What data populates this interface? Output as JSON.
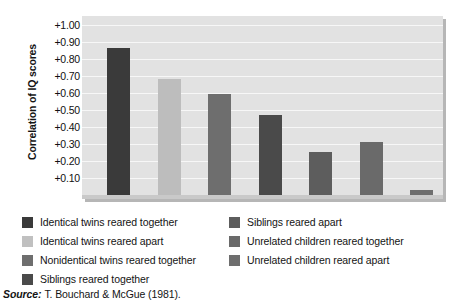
{
  "chart_data": {
    "type": "bar",
    "title": "",
    "xlabel": "",
    "ylabel": "Correlation of IQ scores",
    "ylim": [
      0.0,
      1.05
    ],
    "grid": true,
    "legend_position": "bottom",
    "ytick_labels": [
      "+1.00",
      "+0.90",
      "+0.80",
      "+0.70",
      "+0.60",
      "+0.50",
      "+0.40",
      "+0.30",
      "+0.20",
      "+0.10"
    ],
    "ytick_values": [
      1.0,
      0.9,
      0.8,
      0.7,
      0.6,
      0.5,
      0.4,
      0.3,
      0.2,
      0.1
    ],
    "categories": [
      "Identical twins reared together",
      "Identical twins reared apart",
      "Nonidentical twins reared together",
      "Siblings reared together",
      "Siblings reared apart",
      "Unrelated children reared together",
      "Unrelated children reared apart"
    ],
    "values": [
      0.86,
      0.68,
      0.59,
      0.47,
      0.25,
      0.31,
      0.03
    ],
    "bar_colors": [
      "#3a3a3a",
      "#bdbdbd",
      "#6e6e6e",
      "#4a4a4a",
      "#5d5d5d",
      "#6a6a6a",
      "#6e6e6e"
    ]
  },
  "axis": {
    "y_title": "Correlation of IQ scores"
  },
  "legend": {
    "left_column": [
      {
        "label": "Identical twins reared together",
        "color": "#3a3a3a"
      },
      {
        "label": "Identical twins reared apart",
        "color": "#c0c0c0"
      },
      {
        "label": "Nonidentical twins reared together",
        "color": "#6e6e6e"
      },
      {
        "label": "Siblings reared together",
        "color": "#4a4a4a"
      }
    ],
    "right_column": [
      {
        "label": "Siblings reared apart",
        "color": "#5d5d5d"
      },
      {
        "label": "Unrelated children reared together",
        "color": "#6a6a6a"
      },
      {
        "label": "Unrelated children reared apart",
        "color": "#6e6e6e"
      }
    ]
  },
  "source": {
    "label": "Source:",
    "text": "T. Bouchard & McGue (1981)."
  },
  "colors": {
    "plot_background": "#e2e2e2",
    "gridline": "#f7f7f7",
    "baseline": "#c9c9c9",
    "shadow": "#b6b6b6",
    "text": "#141414"
  }
}
